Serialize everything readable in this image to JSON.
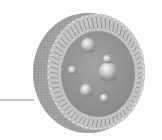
{
  "diagram": {
    "colors": {
      "background": "#ffffff",
      "leader_line": "#8a8a8a",
      "shell_side": "#9a9a9a",
      "shell_head": "#d8d8d8",
      "shell_tail": "#7a7a7a",
      "core": "#8c8c8c",
      "particle_highlight": "#f2f2f2",
      "particle_shade": "#8a8a8a"
    },
    "leader_line": {
      "x1": 0,
      "y1": 100,
      "x2": 34,
      "y2": 100
    },
    "shell": {
      "cx": 92,
      "cy": 72,
      "rx": 57,
      "ry": 60,
      "side_offset": 8
    },
    "core": {
      "cx": 98,
      "cy": 74,
      "rx": 37,
      "ry": 43
    },
    "particles": [
      {
        "cx": 88,
        "cy": 45,
        "r": 7
      },
      {
        "cx": 108,
        "cy": 71,
        "r": 9
      },
      {
        "cx": 107,
        "cy": 59,
        "r": 4
      },
      {
        "cx": 72,
        "cy": 70,
        "r": 4
      },
      {
        "cx": 86,
        "cy": 90,
        "r": 6
      },
      {
        "cx": 104,
        "cy": 98,
        "r": 4
      }
    ]
  }
}
